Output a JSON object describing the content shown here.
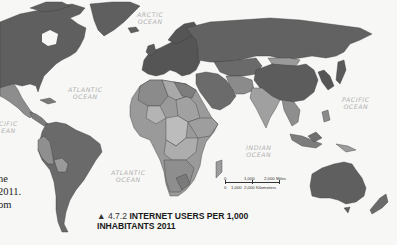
{
  "map": {
    "title_prefix": "▲ 4.7.2",
    "title_line1": "INTERNET USERS PER 1,000",
    "title_line2": "INHABITANTS 2011",
    "ocean_labels": {
      "arctic": "ARCTIC\nOCEAN",
      "atlantic_north": "ATLANTIC\nOCEAN",
      "atlantic_south": "ATLANTIC\nOCEAN",
      "pacific_east": "PACIFIC\nOCEAN",
      "pacific_west": "CIFIC\nEAN",
      "indian": "INDIAN\nOCEAN"
    },
    "scale_bar": {
      "miles_labels": [
        "0",
        "1,000",
        "2,000 Miles"
      ],
      "km_labels": [
        "0",
        "1,000",
        "2,000 Kilometers"
      ]
    },
    "shade_colors": {
      "highest": "#5c5c5c",
      "high": "#6e6e6e",
      "medium": "#8a8a8a",
      "low": "#a3a3a3",
      "lowest": "#bdbdbd",
      "ocean": "#f7f7f5",
      "border": "#3a3a3a"
    }
  },
  "body_text_fragments": [
    "ne",
    "2011.",
    "om"
  ]
}
